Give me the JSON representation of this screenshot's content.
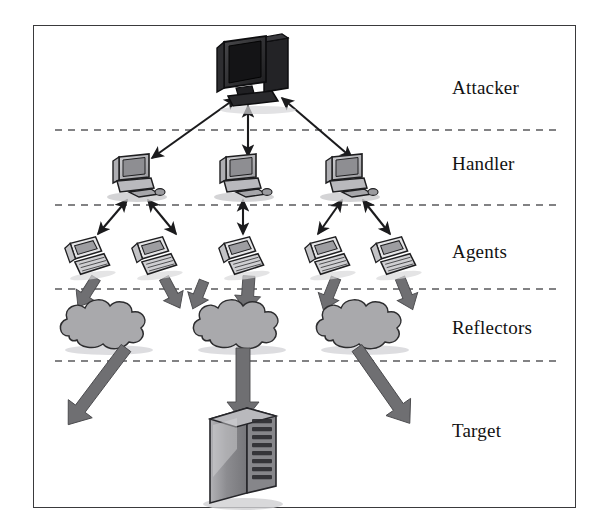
{
  "figure": {
    "frame": {
      "x": 33,
      "y": 25,
      "width": 543,
      "height": 483,
      "border_color": "#3a3a3c"
    },
    "background_color": "#ffffff"
  },
  "bands": [
    {
      "id": "attacker",
      "label": "Attacker",
      "label_x": 452,
      "label_y": 87,
      "node_count": 1
    },
    {
      "id": "handler",
      "label": "Handler",
      "label_x": 452,
      "label_y": 163,
      "node_count": 3
    },
    {
      "id": "agents",
      "label": "Agents",
      "label_x": 452,
      "label_y": 251,
      "node_count": 5
    },
    {
      "id": "reflectors",
      "label": "Reflectors",
      "label_x": 452,
      "label_y": 327,
      "node_count": 3
    },
    {
      "id": "target",
      "label": "Target",
      "label_x": 452,
      "label_y": 430,
      "node_count": 1
    }
  ],
  "dividers": [
    {
      "y": 130,
      "x1": 55,
      "x2": 560
    },
    {
      "y": 205,
      "x1": 55,
      "x2": 560
    },
    {
      "y": 289,
      "x1": 55,
      "x2": 560
    },
    {
      "y": 361,
      "x1": 55,
      "x2": 560
    }
  ],
  "divider_style": {
    "color": "#5a5a5c",
    "dash": "7 6",
    "width": 1.6
  },
  "nodes": {
    "attacker": [
      {
        "id": "attacker-1",
        "icon": "desktop-computer-dark",
        "x": 258,
        "y": 72
      }
    ],
    "handlers": [
      {
        "id": "handler-1",
        "icon": "desktop-computer-gray",
        "x": 137,
        "y": 175
      },
      {
        "id": "handler-2",
        "icon": "desktop-computer-gray",
        "x": 244,
        "y": 175
      },
      {
        "id": "handler-3",
        "icon": "desktop-computer-gray",
        "x": 350,
        "y": 175
      }
    ],
    "agents": [
      {
        "id": "agent-1",
        "icon": "agent-computer",
        "x": 88,
        "y": 255
      },
      {
        "id": "agent-2",
        "icon": "agent-computer",
        "x": 155,
        "y": 255
      },
      {
        "id": "agent-3",
        "icon": "agent-computer",
        "x": 242,
        "y": 255
      },
      {
        "id": "agent-4",
        "icon": "agent-computer",
        "x": 328,
        "y": 255
      },
      {
        "id": "agent-5",
        "icon": "agent-computer",
        "x": 394,
        "y": 255
      }
    ],
    "reflectors": [
      {
        "id": "reflector-1",
        "icon": "cloud",
        "x": 107,
        "y": 325
      },
      {
        "id": "reflector-2",
        "icon": "cloud",
        "x": 240,
        "y": 325
      },
      {
        "id": "reflector-3",
        "icon": "cloud",
        "x": 363,
        "y": 325
      }
    ],
    "target": [
      {
        "id": "target-1",
        "icon": "server-tower",
        "x": 243,
        "y": 455
      }
    ]
  },
  "links": {
    "attacker_to_handlers": [
      {
        "from": "attacker-1",
        "to": "handler-1",
        "style": "double-arrow-thin"
      },
      {
        "from": "attacker-1",
        "to": "handler-2",
        "style": "double-arrow-thin"
      },
      {
        "from": "attacker-1",
        "to": "handler-3",
        "style": "double-arrow-thin"
      }
    ],
    "handlers_to_agents": [
      {
        "from": "handler-1",
        "to": "agent-1",
        "style": "double-arrow-thin"
      },
      {
        "from": "handler-1",
        "to": "agent-2",
        "style": "double-arrow-thin"
      },
      {
        "from": "handler-2",
        "to": "agent-3",
        "style": "double-arrow-thin"
      },
      {
        "from": "handler-3",
        "to": "agent-4",
        "style": "double-arrow-thin"
      },
      {
        "from": "handler-3",
        "to": "agent-5",
        "style": "double-arrow-thin"
      }
    ],
    "agents_to_reflectors": [
      {
        "from": "agent-1",
        "to": "reflector-1",
        "style": "block-arrow-gray"
      },
      {
        "from": "agent-2",
        "to": "reflector-1",
        "style": "block-arrow-gray"
      },
      {
        "from": "agent-3",
        "to": "reflector-2",
        "style": "block-arrow-gray"
      },
      {
        "from": "agent-3",
        "to": "reflector-2b",
        "style": "block-arrow-gray"
      },
      {
        "from": "agent-4",
        "to": "reflector-3",
        "style": "block-arrow-gray"
      },
      {
        "from": "agent-5",
        "to": "reflector-3",
        "style": "block-arrow-gray"
      }
    ],
    "reflectors_to_target": [
      {
        "from": "reflector-1",
        "to": "target-1",
        "style": "block-arrow-gray-long"
      },
      {
        "from": "reflector-2",
        "to": "target-1",
        "style": "block-arrow-gray-long"
      },
      {
        "from": "reflector-3",
        "to": "target-1",
        "style": "block-arrow-gray-long"
      }
    ]
  },
  "colors": {
    "arrow_thin": "#1b1b1d",
    "arrow_block": "#6f6f72",
    "arrow_block_edge": "#4a4a4d",
    "cloud_fill": "#a9a9ac",
    "cloud_edge": "#2d2d2f",
    "computer_gray": "#b4b4b7",
    "computer_dark": "#2b2b2d",
    "server_fill": "#9a9a9e",
    "shadow": "#c9c9cc"
  }
}
